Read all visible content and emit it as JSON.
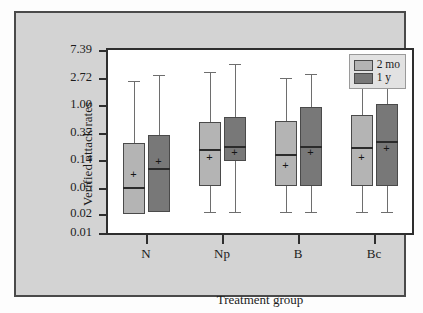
{
  "chart_data": {
    "type": "box",
    "title": "",
    "xlabel": "Treatment group",
    "ylabel": "Verified attack rates",
    "yscale": "log",
    "ylim": [
      0.01,
      7.39
    ],
    "yticks": [
      7.39,
      2.72,
      1.0,
      0.37,
      0.14,
      0.05,
      0.02,
      0.01
    ],
    "ytick_labels": [
      "7.39",
      "2.72",
      "1.00",
      "0.37",
      "0.14",
      "0.05",
      "0.02",
      "0.01"
    ],
    "categories": [
      "N",
      "Np",
      "B",
      "Bc"
    ],
    "grid": false,
    "legend_position": "top-right",
    "series": [
      {
        "name": "2 mo",
        "color": "#b4b4b4",
        "boxes": [
          {
            "category": "N",
            "whisker_low": 0.02,
            "q1": 0.02,
            "median": 0.052,
            "q3": 0.26,
            "whisker_high": 2.4,
            "mean": 0.085
          },
          {
            "category": "Np",
            "whisker_low": 0.021,
            "q1": 0.055,
            "median": 0.21,
            "q3": 0.55,
            "whisker_high": 3.4,
            "mean": 0.155
          },
          {
            "category": "B",
            "whisker_low": 0.021,
            "q1": 0.055,
            "median": 0.175,
            "q3": 0.57,
            "whisker_high": 2.7,
            "mean": 0.115
          },
          {
            "category": "Bc",
            "whisker_low": 0.021,
            "q1": 0.055,
            "median": 0.225,
            "q3": 0.72,
            "whisker_high": 2.7,
            "mean": 0.155
          }
        ]
      },
      {
        "name": "1 y",
        "color": "#787878",
        "boxes": [
          {
            "category": "N",
            "whisker_low": 0.02,
            "q1": 0.021,
            "median": 0.105,
            "q3": 0.34,
            "whisker_high": 2.95,
            "mean": 0.135
          },
          {
            "category": "Np",
            "whisker_low": 0.021,
            "q1": 0.135,
            "median": 0.235,
            "q3": 0.66,
            "whisker_high": 4.5,
            "mean": 0.185
          },
          {
            "category": "B",
            "whisker_low": 0.021,
            "q1": 0.055,
            "median": 0.23,
            "q3": 0.95,
            "whisker_high": 3.1,
            "mean": 0.185
          },
          {
            "category": "Bc",
            "whisker_low": 0.021,
            "q1": 0.055,
            "median": 0.28,
            "q3": 1.05,
            "whisker_high": 2.8,
            "mean": 0.215
          }
        ]
      }
    ]
  },
  "legend": {
    "items": [
      {
        "label": "2 mo",
        "color": "#b4b4b4"
      },
      {
        "label": "1 y",
        "color": "#787878"
      }
    ]
  },
  "axis": {
    "y_title": "Verified attack rates",
    "x_title": "Treatment group"
  },
  "mean_marker_glyph": "+"
}
